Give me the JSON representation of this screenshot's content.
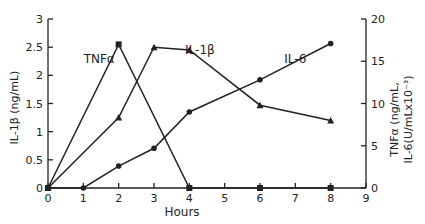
{
  "chart_data": {
    "type": "line",
    "title": "",
    "xlabel": "Hours",
    "ylabel_left": "IL-1β (ng/mL)",
    "ylabel_right_line1": "TNFα (ng/mL,",
    "ylabel_right_line2": "IL-6(U/mLx10⁻³)",
    "x_ticks": [
      0,
      1,
      2,
      3,
      4,
      5,
      6,
      7,
      8,
      9
    ],
    "y_left_ticks": [
      "0",
      "0.5",
      "1",
      "1.5",
      "2",
      "2.5",
      "3"
    ],
    "y_right_ticks": [
      "0",
      "5",
      "10",
      "15",
      "20"
    ],
    "xlim": [
      0,
      9
    ],
    "ylim_left": [
      0,
      3
    ],
    "ylim_right": [
      0,
      20
    ],
    "grid": false,
    "legend": "inline labels",
    "series": [
      {
        "name": "TNFα",
        "axis": "right",
        "marker": "square",
        "x": [
          0,
          2,
          4,
          6,
          8
        ],
        "values": [
          0,
          17,
          0,
          0,
          0
        ],
        "label_pos": {
          "x": 1.45,
          "y": 14.8
        }
      },
      {
        "name": "IL-1β",
        "axis": "left",
        "marker": "triangle",
        "x": [
          0,
          2,
          3,
          4,
          6,
          8
        ],
        "values": [
          0,
          1.25,
          2.5,
          2.45,
          1.47,
          1.2
        ],
        "label_pos": {
          "x": 4.3,
          "y": 2.37
        }
      },
      {
        "name": "IL-6",
        "axis": "right",
        "marker": "circle",
        "x": [
          0,
          1,
          2,
          3,
          4,
          6,
          8
        ],
        "values": [
          0,
          0,
          2.6,
          4.7,
          9.0,
          12.8,
          17.1
        ],
        "label_pos": {
          "x": 7.0,
          "y": 14.8
        }
      }
    ]
  }
}
